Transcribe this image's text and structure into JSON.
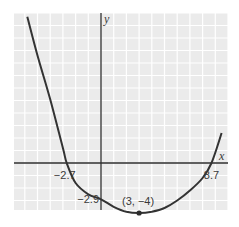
{
  "chart_data": {
    "type": "line",
    "title": "",
    "xlabel": "x",
    "ylabel": "y",
    "xlim": [
      -7,
      10
    ],
    "ylim": [
      -4.7,
      11.7
    ],
    "grid": true,
    "function": "y = (1/33.64)*(x-3)^2*... approx parabola-like quartic with vertex (3, -4)",
    "series": [
      {
        "name": "curve",
        "x": [
          -5.8,
          -5,
          -4,
          -3,
          -2.7,
          -2,
          -1,
          0,
          1,
          2,
          3,
          4,
          5,
          6,
          7,
          8,
          8.7,
          9.5
        ],
        "y": [
          11.7,
          8.6,
          5.1,
          1.2,
          0,
          -1.6,
          -2.5,
          -2.9,
          -3.5,
          -3.9,
          -4,
          -3.9,
          -3.6,
          -3.0,
          -2.2,
          -1.2,
          0,
          2.4
        ]
      }
    ],
    "annotations": [
      {
        "text": "−2.7",
        "x": -2.7,
        "y": 0,
        "kind": "x-intercept"
      },
      {
        "text": "8.7",
        "x": 8.7,
        "y": 0,
        "kind": "x-intercept"
      },
      {
        "text": "−2.9",
        "x": 0,
        "y": -2.9,
        "kind": "y-intercept"
      },
      {
        "text": "(3, −4)",
        "x": 3,
        "y": -4,
        "kind": "vertex"
      }
    ],
    "colors": {
      "grid_bg": "#ebebeb",
      "grid_line": "#ffffff",
      "axis": "#2d2d2d",
      "curve": "#333333"
    }
  }
}
